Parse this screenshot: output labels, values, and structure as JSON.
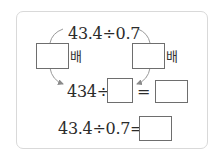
{
  "problem": {
    "top_expression": "43.4÷0.7",
    "left_multiplier": {
      "value": "",
      "unit": "排"
    },
    "right_multiplier": {
      "value": "",
      "unit": "排"
    },
    "row2": {
      "prefix": "434÷",
      "divisor_blank": "",
      "equals": "=",
      "result_blank": ""
    },
    "row3": {
      "prefix": "43.4÷0.7=",
      "answer_blank": ""
    }
  },
  "colors": {
    "border": "#d9d9d9",
    "box_border": "#6e6e6e",
    "arrow": "#8a8a8a",
    "text": "#2b2b2b"
  }
}
